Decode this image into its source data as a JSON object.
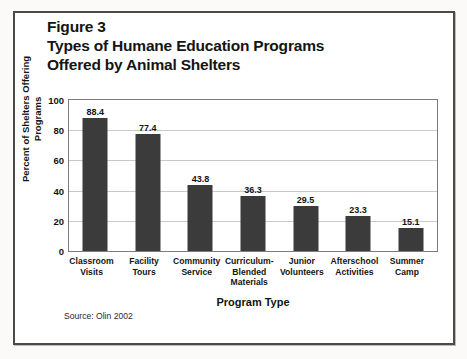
{
  "figure": {
    "title_lines": [
      "Figure 3",
      "Types of Humane Education Programs",
      "Offered by Animal Shelters"
    ],
    "source_note": "Source: Olin 2002"
  },
  "chart_data": {
    "type": "bar",
    "title": "Figure 3 Types of Humane Education Programs Offered by Animal Shelters",
    "xlabel": "Program Type",
    "ylabel": "Percent of Shelters Offering Programs",
    "ylim": [
      0,
      100
    ],
    "yticks": [
      0,
      20,
      40,
      60,
      80,
      100
    ],
    "ytick_labels": [
      "0",
      "20",
      "40",
      "60",
      "80",
      "100"
    ],
    "grid": "horizontal",
    "legend": "none",
    "bar_color": "#3b3b3b",
    "categories": [
      "Classroom Visits",
      "Facility Tours",
      "Community Service",
      "Curriculum-Blended Materials",
      "Junior Volunteers",
      "Afterschool Activities",
      "Summer Camp"
    ],
    "category_lines": [
      [
        "Classroom",
        "Visits"
      ],
      [
        "Facility",
        "Tours"
      ],
      [
        "Community",
        "Service"
      ],
      [
        "Curriculum-",
        "Blended",
        "Materials"
      ],
      [
        "Junior",
        "Volunteers"
      ],
      [
        "Afterschool",
        "Activities"
      ],
      [
        "Summer",
        "Camp"
      ]
    ],
    "values": [
      88.4,
      77.4,
      43.8,
      36.3,
      29.5,
      23.3,
      15.1
    ],
    "value_labels": [
      "88.4",
      "77.4",
      "43.8",
      "36.3",
      "29.5",
      "23.3",
      "15.1"
    ]
  }
}
